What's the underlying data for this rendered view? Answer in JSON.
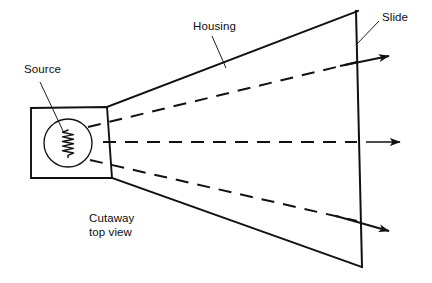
{
  "figure": {
    "type": "technical-line-diagram",
    "background_color": "#ffffff",
    "line_color": "#111111",
    "width": 432,
    "height": 283
  },
  "labels": {
    "source": "Source",
    "housing": "Housing",
    "slide": "Slide",
    "view_note_line1": "Cutaway",
    "view_note_line2": "top view",
    "view_note": "Cutaway\ntop view"
  },
  "icons": {
    "filament": "filament-coil-icon",
    "source_circle": "lamp-source-icon",
    "arrow": "ray-arrow-icon"
  },
  "geometry": {
    "lamp_box": {
      "x1": 31,
      "y1": 108,
      "x2": 112,
      "y2": 178
    },
    "source_circle": {
      "cx": 68,
      "cy": 143,
      "r": 24
    },
    "filament": {
      "x": 68,
      "y_top": 130,
      "y_bottom": 157,
      "zigzags": 7
    },
    "housing_upper_edge": [
      [
        107,
        107
      ],
      [
        358,
        11
      ]
    ],
    "housing_lower_edge": [
      [
        112,
        178
      ],
      [
        362,
        267
      ]
    ],
    "slide_line": [
      [
        356,
        11
      ],
      [
        362,
        267
      ]
    ],
    "rays": [
      {
        "name": "upper-ray",
        "from": [
          88,
          127
        ],
        "to": [
          358,
          62
        ],
        "arrow_tip": [
          389,
          56
        ]
      },
      {
        "name": "center-ray",
        "from": [
          103,
          142
        ],
        "to": [
          358,
          142
        ],
        "arrow_tip": [
          400,
          142
        ]
      },
      {
        "name": "lower-ray",
        "from": [
          90,
          160
        ],
        "to": [
          358,
          222
        ],
        "arrow_tip": [
          389,
          231
        ]
      }
    ],
    "leaders": {
      "source": [
        [
          40,
          82
        ],
        [
          64,
          133
        ]
      ],
      "housing": [
        [
          212,
          36
        ],
        [
          226,
          68
        ]
      ],
      "slide": [
        [
          379,
          20
        ],
        [
          356,
          44
        ]
      ]
    }
  },
  "colors": {
    "ink": "#111111",
    "paper": "#ffffff",
    "text": "#0d0d0d"
  }
}
